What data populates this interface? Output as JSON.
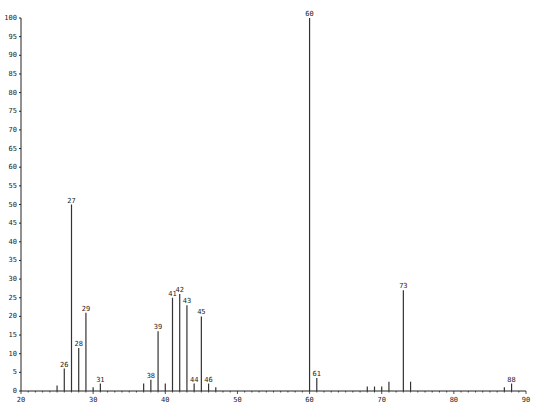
{
  "chart_data": {
    "type": "bar",
    "title": "",
    "xlabel": "",
    "ylabel": "",
    "xlim": [
      20,
      90
    ],
    "ylim": [
      0,
      100
    ],
    "grid": false,
    "legend": null,
    "x_ticks": [
      20,
      30,
      40,
      50,
      60,
      70,
      80,
      90
    ],
    "y_ticks": [
      0,
      5,
      10,
      15,
      20,
      25,
      30,
      35,
      40,
      45,
      50,
      55,
      60,
      65,
      70,
      75,
      80,
      85,
      90,
      95,
      100
    ],
    "peaks": [
      {
        "mz": 25,
        "intensity": 1.5,
        "label": ""
      },
      {
        "mz": 26,
        "intensity": 6,
        "label": "26"
      },
      {
        "mz": 27,
        "intensity": 50,
        "label": "27"
      },
      {
        "mz": 28,
        "intensity": 11.5,
        "label": "28"
      },
      {
        "mz": 29,
        "intensity": 21,
        "label": "29"
      },
      {
        "mz": 30,
        "intensity": 1,
        "label": ""
      },
      {
        "mz": 31,
        "intensity": 2,
        "label": "31"
      },
      {
        "mz": 37,
        "intensity": 2,
        "label": ""
      },
      {
        "mz": 38,
        "intensity": 3,
        "label": "38"
      },
      {
        "mz": 39,
        "intensity": 16,
        "label": "39"
      },
      {
        "mz": 40,
        "intensity": 2,
        "label": ""
      },
      {
        "mz": 41,
        "intensity": 25,
        "label": "41"
      },
      {
        "mz": 42,
        "intensity": 26,
        "label": "42"
      },
      {
        "mz": 43,
        "intensity": 23,
        "label": "43"
      },
      {
        "mz": 44,
        "intensity": 2,
        "label": "44"
      },
      {
        "mz": 45,
        "intensity": 20,
        "label": "45"
      },
      {
        "mz": 46,
        "intensity": 2,
        "label": "46"
      },
      {
        "mz": 47,
        "intensity": 1,
        "label": ""
      },
      {
        "mz": 60,
        "intensity": 100,
        "label": "60"
      },
      {
        "mz": 61,
        "intensity": 3.5,
        "label": "61"
      },
      {
        "mz": 68,
        "intensity": 1.2,
        "label": ""
      },
      {
        "mz": 69,
        "intensity": 1.2,
        "label": ""
      },
      {
        "mz": 70,
        "intensity": 1.2,
        "label": ""
      },
      {
        "mz": 71,
        "intensity": 2.5,
        "label": ""
      },
      {
        "mz": 73,
        "intensity": 27,
        "label": "73"
      },
      {
        "mz": 74,
        "intensity": 2.5,
        "label": ""
      },
      {
        "mz": 87,
        "intensity": 1,
        "label": ""
      },
      {
        "mz": 88,
        "intensity": 2,
        "label": "88"
      }
    ]
  },
  "plot": {
    "origin_x": 21,
    "origin_y": 391,
    "x_max_px": 526,
    "y_max_px": 18,
    "axis_color": "#222222",
    "bar_color": "#333333"
  }
}
